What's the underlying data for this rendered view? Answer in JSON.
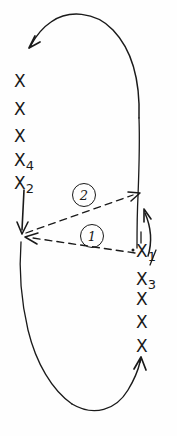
{
  "figure": {
    "type": "hand-drawn-diagram",
    "title": "",
    "background_color": "#fefefe",
    "ink_color": "#1a1a1a",
    "width": 177,
    "height": 436
  },
  "diagram_data": {
    "type": "diagram",
    "description": "Hand-drawn closed oval loop traced counter-clockwise with X tick marks along the left and right sides; two dashed arrows labelled with circled numbers connect points on the right side to points on the left side.",
    "left_column_marks": [
      {
        "symbol": "X",
        "subscript": ""
      },
      {
        "symbol": "X",
        "subscript": ""
      },
      {
        "symbol": "X",
        "subscript": ""
      },
      {
        "symbol": "X",
        "subscript": "4"
      },
      {
        "symbol": "X",
        "subscript": "2"
      }
    ],
    "right_column_marks": [
      {
        "symbol": "X",
        "subscript": "1"
      },
      {
        "symbol": "X",
        "subscript": "3"
      },
      {
        "symbol": "X",
        "subscript": ""
      },
      {
        "symbol": "X",
        "subscript": ""
      },
      {
        "symbol": "X",
        "subscript": ""
      }
    ],
    "annotations": [
      {
        "id": "1",
        "label": "1",
        "style": "circled",
        "attached_to": "dashed-arrow-1"
      },
      {
        "id": "2",
        "label": "2",
        "style": "circled",
        "attached_to": "dashed-arrow-2"
      }
    ],
    "arrows": [
      {
        "name": "dashed-arrow-1",
        "style": "dashed",
        "direction": "right-to-left",
        "from": "X1",
        "to": "X2"
      },
      {
        "name": "dashed-arrow-2",
        "style": "dashed",
        "direction": "left-to-right",
        "from": "X2",
        "to": "right-side"
      },
      {
        "name": "loop-arrow-top-left",
        "style": "solid",
        "direction": "down-left"
      },
      {
        "name": "loop-arrow-bottom-right",
        "style": "solid",
        "direction": "up-right"
      },
      {
        "name": "vertical-arrow-left",
        "style": "solid",
        "direction": "down"
      },
      {
        "name": "vertical-arrow-right",
        "style": "solid",
        "direction": "up"
      }
    ]
  },
  "marks": {
    "left": {
      "m0": {
        "x": "X",
        "sub": ""
      },
      "m1": {
        "x": "X",
        "sub": ""
      },
      "m2": {
        "x": "X",
        "sub": ""
      },
      "m3": {
        "x": "X",
        "sub": "4"
      },
      "m4": {
        "x": "X",
        "sub": "2"
      }
    },
    "right": {
      "m0": {
        "x": "X",
        "sub": "1"
      },
      "m1": {
        "x": "X",
        "sub": "3"
      },
      "m2": {
        "x": "X",
        "sub": ""
      },
      "m3": {
        "x": "X",
        "sub": ""
      },
      "m4": {
        "x": "X",
        "sub": ""
      }
    }
  },
  "labels": {
    "circle_one": "1",
    "circle_two": "2"
  }
}
